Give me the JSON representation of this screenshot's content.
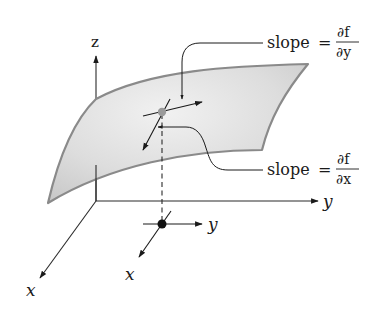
{
  "figure": {
    "axes": {
      "z_label": "z",
      "y_label": "y",
      "x_label": "x"
    },
    "base_point_axes": {
      "y_label": "y",
      "x_label": "x"
    },
    "annotations": [
      {
        "id": "slope-y",
        "prefix": "slope",
        "equals": "=",
        "numerator": "∂f",
        "denominator": "∂y"
      },
      {
        "id": "slope-x",
        "prefix": "slope",
        "equals": "=",
        "numerator": "∂f",
        "denominator": "∂x"
      }
    ],
    "colors": {
      "surface_fill": "#d8d8d8",
      "surface_edge": "#8a8a8a",
      "surface_point": "#9a9a9a",
      "base_point": "#111111",
      "line": "#2a2a2a"
    }
  }
}
